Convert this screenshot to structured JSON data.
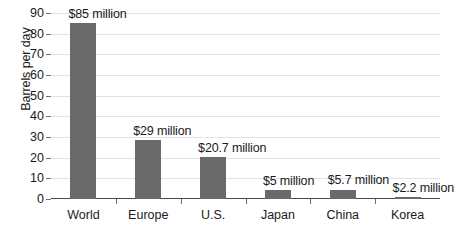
{
  "chart_data": {
    "type": "bar",
    "title": "",
    "xlabel": "",
    "ylabel": "Barrels per day",
    "ylim": [
      0,
      90
    ],
    "ytick_step": 10,
    "yticks": [
      "90",
      "80",
      "70",
      "60",
      "50",
      "40",
      "30",
      "20",
      "10",
      "0"
    ],
    "grid": true,
    "legend": "none",
    "categories": [
      "World",
      "Europe",
      "U.S.",
      "Japan",
      "China",
      "Korea"
    ],
    "values": [
      85,
      28.5,
      20.2,
      4.2,
      4.6,
      1.2
    ],
    "data_labels": [
      "$85 million",
      "$29 million",
      "$20.7 million",
      "$5 million",
      "$5.7 million",
      "$2.2 million"
    ],
    "bars": [
      {
        "category": "World",
        "value": 85,
        "label": "$85 million"
      },
      {
        "category": "Europe",
        "value": 28.5,
        "label": "$29 million"
      },
      {
        "category": "U.S.",
        "value": 20.2,
        "label": "$20.7 million"
      },
      {
        "category": "Japan",
        "value": 4.2,
        "label": "$5 million"
      },
      {
        "category": "China",
        "value": 4.6,
        "label": "$5.7 million"
      },
      {
        "category": "Korea",
        "value": 1.2,
        "label": "$2.2 million"
      }
    ],
    "colors": {
      "bar": "#6a6a6a",
      "gridline": "#e3e3e3",
      "axis": "#4a4a4a",
      "text": "#1a1a1a",
      "background": "#ffffff"
    }
  }
}
